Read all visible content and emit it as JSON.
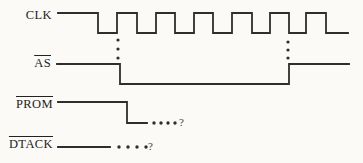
{
  "figure": {
    "kind": "bus-timing-diagram",
    "canvas": {
      "width": 363,
      "height": 163,
      "background": "#fbfaf7",
      "line_color": "#2e2e2e",
      "text_color": "#222222"
    },
    "signals": [
      {
        "name": "CLK",
        "overline": false,
        "label_pos": {
          "right": 52,
          "center_y": 15
        },
        "polyline": [
          [
            58,
            13
          ],
          [
            98,
            13
          ],
          [
            98,
            33
          ],
          [
            117,
            33
          ],
          [
            117,
            13
          ],
          [
            137,
            13
          ],
          [
            137,
            33
          ],
          [
            156,
            33
          ],
          [
            156,
            13
          ],
          [
            175,
            13
          ],
          [
            175,
            33
          ],
          [
            194,
            33
          ],
          [
            194,
            13
          ],
          [
            213,
            13
          ],
          [
            213,
            33
          ],
          [
            232,
            33
          ],
          [
            232,
            13
          ],
          [
            252,
            13
          ],
          [
            252,
            33
          ],
          [
            270,
            33
          ],
          [
            270,
            13
          ],
          [
            289,
            13
          ],
          [
            289,
            33
          ],
          [
            306,
            33
          ],
          [
            306,
            13
          ],
          [
            326,
            13
          ],
          [
            326,
            33
          ],
          [
            348,
            33
          ]
        ]
      },
      {
        "name": "AS",
        "overline": true,
        "label_pos": {
          "right": 51,
          "center_y": 63
        },
        "polyline": [
          [
            57,
            64
          ],
          [
            120,
            64
          ],
          [
            120,
            84
          ],
          [
            289,
            84
          ],
          [
            289,
            64
          ],
          [
            349,
            64
          ]
        ]
      },
      {
        "name": "PROM",
        "overline": true,
        "label_pos": {
          "right": 53,
          "center_y": 104
        },
        "polyline": [
          [
            58,
            102
          ],
          [
            127,
            102
          ],
          [
            127,
            123
          ],
          [
            147,
            123
          ]
        ],
        "trail_dots": {
          "y": 123,
          "xs": [
            154,
            161,
            168,
            175
          ]
        },
        "question_mark": {
          "text": "?",
          "x": 179,
          "center_y": 123
        }
      },
      {
        "name": "DTACK",
        "overline": true,
        "label_pos": {
          "right": 53,
          "center_y": 144
        },
        "polyline": [
          [
            58,
            147
          ],
          [
            110,
            147
          ]
        ],
        "trail_dots": {
          "y": 147,
          "xs": [
            119,
            128,
            137,
            146
          ]
        },
        "question_mark": {
          "text": "?",
          "x": 148,
          "center_y": 147
        }
      }
    ],
    "sync_dot_columns": [
      {
        "x": 118,
        "ys": [
          40,
          49,
          58
        ]
      },
      {
        "x": 288,
        "ys": [
          42,
          50,
          58
        ]
      }
    ]
  }
}
